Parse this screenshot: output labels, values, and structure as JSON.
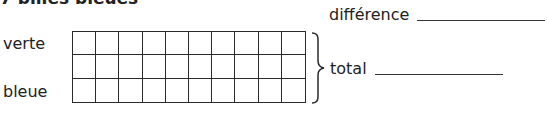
{
  "heading": "7 billes bleues",
  "rows": {
    "verte_label": "verte",
    "bleue_label": "bleue"
  },
  "grid": {
    "columns": 10,
    "rows": 3,
    "line_color": "#2a2a2a"
  },
  "answers": {
    "difference_label": "différence",
    "difference_value": "",
    "total_label": "total",
    "total_value": ""
  }
}
